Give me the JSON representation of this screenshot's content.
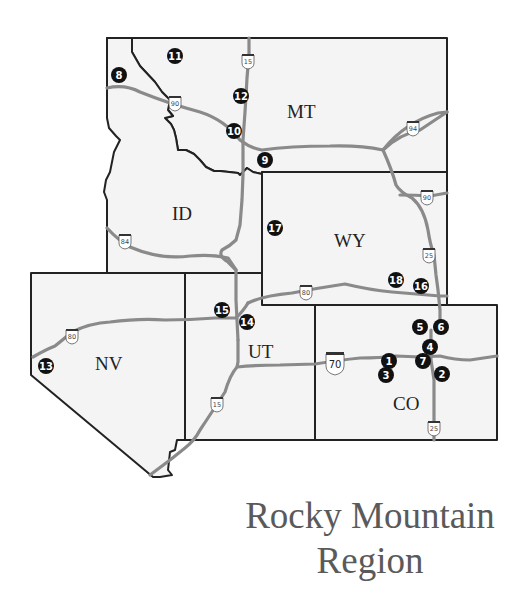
{
  "title": {
    "line1": "Rocky Mountain",
    "line2": "Region"
  },
  "states": [
    {
      "id": "MT",
      "label": "MT"
    },
    {
      "id": "ID",
      "label": "ID"
    },
    {
      "id": "WY",
      "label": "WY"
    },
    {
      "id": "NV",
      "label": "NV"
    },
    {
      "id": "UT",
      "label": "UT"
    },
    {
      "id": "CO",
      "label": "CO"
    }
  ],
  "interstates": [
    {
      "id": "i15-mt",
      "label": "15"
    },
    {
      "id": "i90-mt",
      "label": "90"
    },
    {
      "id": "i94",
      "label": "94"
    },
    {
      "id": "i90-wy",
      "label": "90"
    },
    {
      "id": "i84",
      "label": "84"
    },
    {
      "id": "i25-wy",
      "label": "25"
    },
    {
      "id": "i80-wy",
      "label": "80"
    },
    {
      "id": "i80-nv",
      "label": "80"
    },
    {
      "id": "i70",
      "label": "70"
    },
    {
      "id": "i15-ut",
      "label": "15"
    },
    {
      "id": "i25-co",
      "label": "25"
    }
  ],
  "markers": [
    {
      "number": "1",
      "state": "CO"
    },
    {
      "number": "2",
      "state": "CO"
    },
    {
      "number": "3",
      "state": "CO"
    },
    {
      "number": "4",
      "state": "CO"
    },
    {
      "number": "5",
      "state": "CO"
    },
    {
      "number": "6",
      "state": "CO"
    },
    {
      "number": "7",
      "state": "CO"
    },
    {
      "number": "8",
      "state": "ID"
    },
    {
      "number": "9",
      "state": "MT"
    },
    {
      "number": "10",
      "state": "MT"
    },
    {
      "number": "11",
      "state": "MT"
    },
    {
      "number": "12",
      "state": "MT"
    },
    {
      "number": "13",
      "state": "NV"
    },
    {
      "number": "14",
      "state": "UT"
    },
    {
      "number": "15",
      "state": "UT"
    },
    {
      "number": "16",
      "state": "WY"
    },
    {
      "number": "17",
      "state": "WY"
    },
    {
      "number": "18",
      "state": "WY"
    }
  ],
  "colors": {
    "land": "#f4f4f4",
    "border": "#222222",
    "road": "#8a8a8a",
    "marker": "#111111",
    "title": "#5a5a5a"
  }
}
